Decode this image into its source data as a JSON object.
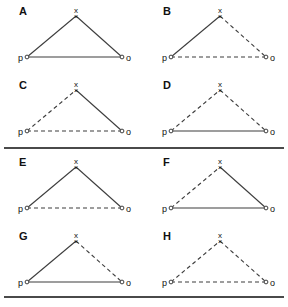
{
  "figure": {
    "vertex_labels": {
      "p": "p",
      "x": "x",
      "o": "o"
    },
    "apex_marker": "×",
    "colors": {
      "line": "#3d3d3d",
      "divider": "#4a4a4a",
      "text": "#111111",
      "background": "#ffffff"
    },
    "geometry": {
      "p": {
        "x": 27,
        "y": 55
      },
      "x": {
        "x": 76,
        "y": 14
      },
      "o": {
        "x": 122,
        "y": 55
      }
    },
    "groups": [
      {
        "name": "group-top",
        "panels": [
          {
            "letter": "A",
            "edges": {
              "p_x": "solid",
              "x_o": "solid",
              "p_o": "solid"
            }
          },
          {
            "letter": "B",
            "edges": {
              "p_x": "solid",
              "x_o": "dashed",
              "p_o": "dashed"
            }
          },
          {
            "letter": "C",
            "edges": {
              "p_x": "dashed",
              "x_o": "solid",
              "p_o": "dashed"
            }
          },
          {
            "letter": "D",
            "edges": {
              "p_x": "dashed",
              "x_o": "dashed",
              "p_o": "solid"
            }
          }
        ]
      },
      {
        "name": "group-bottom",
        "panels": [
          {
            "letter": "E",
            "edges": {
              "p_x": "solid",
              "x_o": "solid",
              "p_o": "dashed"
            }
          },
          {
            "letter": "F",
            "edges": {
              "p_x": "dashed",
              "x_o": "solid",
              "p_o": "solid"
            }
          },
          {
            "letter": "G",
            "edges": {
              "p_x": "solid",
              "x_o": "dashed",
              "p_o": "solid"
            }
          },
          {
            "letter": "H",
            "edges": {
              "p_x": "dashed",
              "x_o": "dashed",
              "p_o": "dashed"
            }
          }
        ]
      }
    ]
  }
}
